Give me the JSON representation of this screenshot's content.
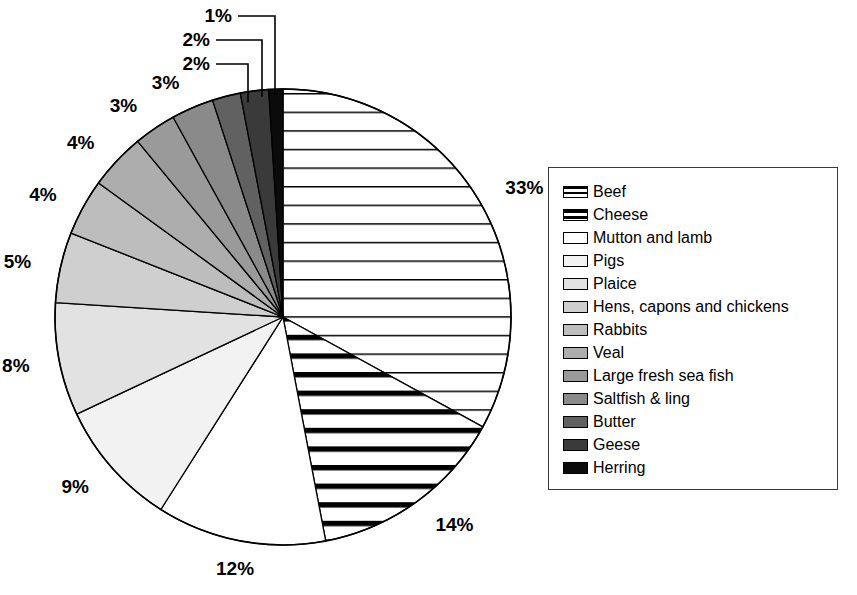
{
  "chart_data": {
    "type": "pie",
    "title": "",
    "legend_position": "right",
    "start_angle_deg": 0,
    "direction": "clockwise",
    "categories": [
      "Beef",
      "Cheese",
      "Mutton and lamb",
      "Pigs",
      "Plaice",
      "Hens, capons and chickens",
      "Rabbits",
      "Veal",
      "Large fresh sea fish",
      "Saltfish & ling",
      "Butter",
      "Geese",
      "Herring"
    ],
    "values": [
      33,
      14,
      12,
      9,
      8,
      5,
      4,
      4,
      3,
      3,
      2,
      2,
      1
    ],
    "value_labels": [
      "33%",
      "14%",
      "12%",
      "9%",
      "8%",
      "5%",
      "4%",
      "4%",
      "3%",
      "3%",
      "2%",
      "2%",
      "1%"
    ],
    "units": "percent",
    "fills": [
      "hatch-thin-horizontal",
      "hatch-thick-horizontal",
      "#ffffff",
      "#f2f2f2",
      "#e2e2e2",
      "#cfcfcf",
      "#bdbdbd",
      "#adadad",
      "#9a9a9a",
      "#8a8a8a",
      "#616161",
      "#3a3a3a",
      "#0b0b0b"
    ],
    "slices": [
      {
        "label": "Beef",
        "value": 33,
        "value_label": "33%",
        "fill": "hatch-thin-horizontal"
      },
      {
        "label": "Cheese",
        "value": 14,
        "value_label": "14%",
        "fill": "hatch-thick-horizontal"
      },
      {
        "label": "Mutton and lamb",
        "value": 12,
        "value_label": "12%",
        "fill": "#ffffff"
      },
      {
        "label": "Pigs",
        "value": 9,
        "value_label": "9%",
        "fill": "#f2f2f2"
      },
      {
        "label": "Plaice",
        "value": 8,
        "value_label": "8%",
        "fill": "#e2e2e2"
      },
      {
        "label": "Hens, capons and chickens",
        "value": 5,
        "value_label": "5%",
        "fill": "#cfcfcf"
      },
      {
        "label": "Rabbits",
        "value": 4,
        "value_label": "4%",
        "fill": "#bdbdbd"
      },
      {
        "label": "Veal",
        "value": 4,
        "value_label": "4%",
        "fill": "#adadad"
      },
      {
        "label": "Large fresh sea fish",
        "value": 3,
        "value_label": "3%",
        "fill": "#9a9a9a"
      },
      {
        "label": "Saltfish & ling",
        "value": 3,
        "value_label": "3%",
        "fill": "#8a8a8a"
      },
      {
        "label": "Butter",
        "value": 2,
        "value_label": "2%",
        "fill": "#616161"
      },
      {
        "label": "Geese",
        "value": 2,
        "value_label": "2%",
        "fill": "#3a3a3a"
      },
      {
        "label": "Herring",
        "value": 1,
        "value_label": "1%",
        "fill": "#0b0b0b"
      }
    ]
  },
  "geometry": {
    "cx": 283,
    "cy": 317,
    "r": 228
  },
  "legend": {
    "items": [
      {
        "label": "Beef"
      },
      {
        "label": "Cheese"
      },
      {
        "label": "Mutton and lamb"
      },
      {
        "label": "Pigs"
      },
      {
        "label": "Plaice"
      },
      {
        "label": "Hens, capons and chickens"
      },
      {
        "label": "Rabbits"
      },
      {
        "label": "Veal"
      },
      {
        "label": "Large fresh sea fish"
      },
      {
        "label": "Saltfish & ling"
      },
      {
        "label": "Butter"
      },
      {
        "label": "Geese"
      },
      {
        "label": "Herring"
      }
    ]
  },
  "labels": {
    "leadered": [
      "2%",
      "2%",
      "1%"
    ]
  }
}
